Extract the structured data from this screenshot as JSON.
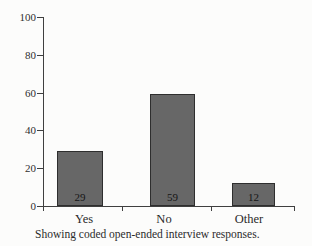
{
  "chart_data": {
    "type": "bar",
    "categories": [
      "Yes",
      "No",
      "Other"
    ],
    "values": [
      29,
      59,
      12
    ],
    "bar_value_labels": [
      "29",
      "59",
      "12"
    ],
    "title": "",
    "xlabel": "",
    "ylabel": "",
    "ylim": [
      0,
      100
    ],
    "yticks": [
      0,
      20,
      40,
      60,
      80,
      100
    ],
    "grid": false,
    "legend": "none",
    "bar_color": "#676767",
    "bar_border_color": "#2e2e2e",
    "axis_color": "#3f3f3f",
    "text_color": "#2a2a2a",
    "background_color": "#fcfcfb"
  },
  "caption": "Showing coded open-ended interview responses."
}
